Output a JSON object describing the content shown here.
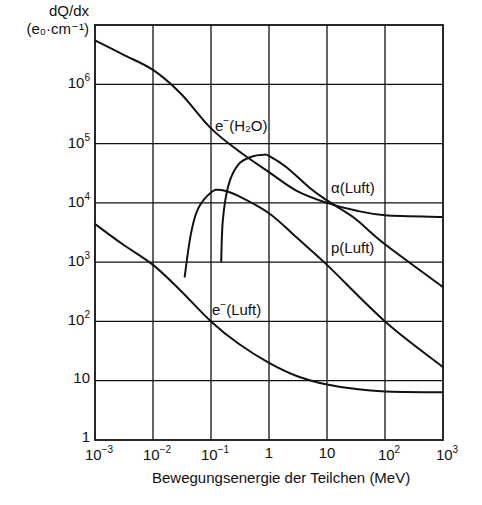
{
  "chart_data": {
    "type": "line",
    "title": "",
    "ylabel_line1": "dQ/dx",
    "ylabel_line2": "(e₀·cm⁻¹)",
    "xlabel": "Bewegungsenergie der Teilchen (MeV)",
    "xscale": "log",
    "yscale": "log",
    "xlim": [
      0.001,
      1000
    ],
    "ylim": [
      1,
      10000000
    ],
    "grid": true,
    "x_ticks": [
      {
        "base": "10",
        "exp": "−3"
      },
      {
        "base": "10",
        "exp": "−2"
      },
      {
        "base": "10",
        "exp": "−1"
      },
      {
        "base": "1",
        "exp": ""
      },
      {
        "base": "10",
        "exp": ""
      },
      {
        "base": "10",
        "exp": "2"
      },
      {
        "base": "10",
        "exp": "3"
      }
    ],
    "y_ticks": [
      {
        "base": "10",
        "exp": "6"
      },
      {
        "base": "10",
        "exp": "5"
      },
      {
        "base": "10",
        "exp": "4"
      },
      {
        "base": "10",
        "exp": "3"
      },
      {
        "base": "10",
        "exp": "2"
      },
      {
        "base": "10",
        "exp": ""
      },
      {
        "base": "1",
        "exp": ""
      }
    ],
    "series": [
      {
        "name": "e⁻(H₂O)",
        "label_base": "e",
        "label_sup": "−",
        "label_rest": "(H₂O)",
        "x": [
          0.001,
          0.003,
          0.01,
          0.03,
          0.1,
          0.3,
          1,
          3,
          10,
          30,
          100,
          1000
        ],
        "y": [
          5500000,
          3200000,
          1750000,
          700000,
          180000,
          75000,
          33000,
          16000,
          10000,
          7500,
          6200,
          5800
        ]
      },
      {
        "name": "α(Luft)",
        "label_base": "α(Luft)",
        "x": [
          0.15,
          0.16,
          0.2,
          0.3,
          0.5,
          0.8,
          1,
          2,
          5,
          10,
          30,
          100,
          1000
        ],
        "y": [
          1000,
          5000,
          20000,
          45000,
          60000,
          65000,
          62000,
          40000,
          18000,
          11000,
          5500,
          2000,
          380
        ]
      },
      {
        "name": "p(Luft)",
        "label_base": "p(Luft)",
        "x": [
          0.035,
          0.045,
          0.06,
          0.1,
          0.15,
          0.3,
          1,
          3,
          10,
          100,
          1000
        ],
        "y": [
          550,
          3000,
          8000,
          15000,
          16500,
          13000,
          6700,
          2600,
          900,
          100,
          17
        ]
      },
      {
        "name": "e⁻(Luft)",
        "label_base": "e",
        "label_sup": "−",
        "label_rest": "(Luft)",
        "x": [
          0.001,
          0.003,
          0.01,
          0.03,
          0.1,
          0.3,
          1,
          3,
          10,
          30,
          100,
          1000
        ],
        "y": [
          4400,
          2000,
          900,
          330,
          100,
          42,
          20,
          12,
          8.6,
          7.3,
          6.6,
          6.4
        ]
      }
    ],
    "annotations": [
      {
        "text": "e⁻(H₂O)",
        "x": 0.2,
        "y": 100000
      },
      {
        "text": "α(Luft)",
        "x": 12,
        "y": 20000
      },
      {
        "text": "p(Luft)",
        "x": 12,
        "y": 2000
      },
      {
        "text": "e⁻(Luft)",
        "x": 0.1,
        "y": 150
      }
    ]
  }
}
